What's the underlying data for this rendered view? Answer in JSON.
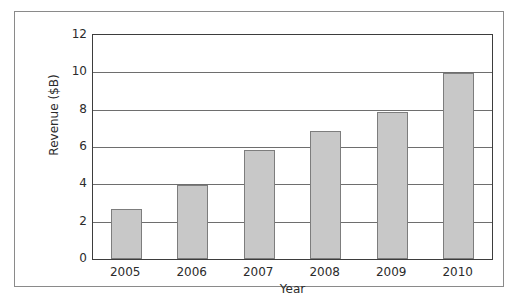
{
  "chart_data": {
    "type": "bar",
    "title": "",
    "subtitle": "",
    "xlabel": "Year",
    "ylabel": "Revenue ($B)",
    "categories": [
      "2005",
      "2006",
      "2007",
      "2008",
      "2009",
      "2010"
    ],
    "values": [
      2.7,
      3.95,
      5.85,
      6.85,
      7.85,
      9.95
    ],
    "series": [
      {
        "name": "Revenue",
        "values": [
          2.7,
          3.95,
          5.85,
          6.85,
          7.85,
          9.95
        ]
      }
    ],
    "ylim": [
      0,
      12
    ],
    "ytick_labels": [
      "0",
      "2",
      "4",
      "6",
      "8",
      "10",
      "12"
    ],
    "ytick_values": [
      0,
      2,
      4,
      6,
      8,
      10,
      12
    ],
    "xtick_labels": [
      "2005",
      "2006",
      "2007",
      "2008",
      "2009",
      "2010"
    ],
    "grid": "horizontal",
    "legend": "none",
    "legend_position": "",
    "annotations": [],
    "colors": {
      "bar_fill": "#c8c8c8",
      "bar_border": "#7d7d7d",
      "gridline": "#6e6e6e",
      "axis": "#3d3d3d",
      "frame": "#8a8a8a",
      "text": "#2b2b2b",
      "background": "#ffffff"
    }
  }
}
